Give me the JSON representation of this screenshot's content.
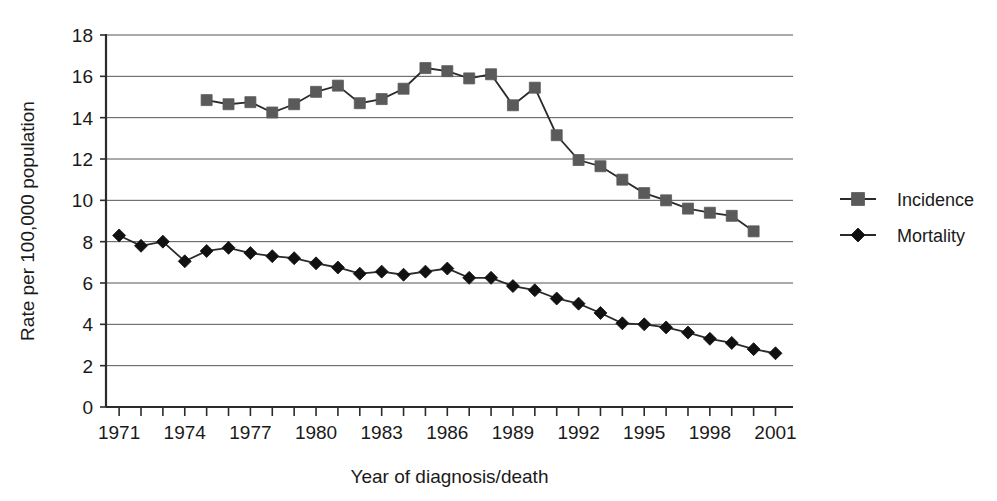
{
  "chart_data": {
    "type": "line",
    "title": "",
    "xlabel": "Year of diagnosis/death",
    "ylabel": "Rate per 100,000 population",
    "xlim": [
      1970.4,
      2001.8
    ],
    "ylim": [
      0,
      18
    ],
    "yticks": [
      0,
      2,
      4,
      6,
      8,
      10,
      12,
      14,
      16,
      18
    ],
    "ytick_labels": [
      "0",
      "2",
      "4",
      "6",
      "8",
      "10",
      "12",
      "14",
      "16",
      "18"
    ],
    "xticks": [
      1971,
      1972,
      1973,
      1974,
      1975,
      1976,
      1977,
      1978,
      1979,
      1980,
      1981,
      1982,
      1983,
      1984,
      1985,
      1986,
      1987,
      1988,
      1989,
      1990,
      1991,
      1992,
      1993,
      1994,
      1995,
      1996,
      1997,
      1998,
      1999,
      2000,
      2001
    ],
    "xtick_labels_shown": [
      "1971",
      "1974",
      "1977",
      "1980",
      "1983",
      "1986",
      "1989",
      "1992",
      "1995",
      "1998",
      "2001"
    ],
    "grid": "horizontal",
    "legend_position": "right",
    "series": [
      {
        "name": "Incidence",
        "marker": "square",
        "color": "#5a5a5a",
        "line_color": "#2a2a2a",
        "x": [
          1975,
          1976,
          1977,
          1978,
          1979,
          1980,
          1981,
          1982,
          1983,
          1984,
          1985,
          1986,
          1987,
          1988,
          1989,
          1990,
          1991,
          1992,
          1993,
          1994,
          1995,
          1996,
          1997,
          1998,
          1999,
          2000
        ],
        "values": [
          14.85,
          14.65,
          14.75,
          14.25,
          14.65,
          15.25,
          15.55,
          14.7,
          14.9,
          15.4,
          16.4,
          16.25,
          15.9,
          16.1,
          14.6,
          15.45,
          13.15,
          11.95,
          11.65,
          11.0,
          10.35,
          10.0,
          9.6,
          9.4,
          9.25,
          8.5
        ]
      },
      {
        "name": "Mortality",
        "marker": "diamond",
        "color": "#111111",
        "line_color": "#2a2a2a",
        "x": [
          1971,
          1972,
          1973,
          1974,
          1975,
          1976,
          1977,
          1978,
          1979,
          1980,
          1981,
          1982,
          1983,
          1984,
          1985,
          1986,
          1987,
          1988,
          1989,
          1990,
          1991,
          1992,
          1993,
          1994,
          1995,
          1996,
          1997,
          1998,
          1999,
          2000,
          2001
        ],
        "values": [
          8.3,
          7.8,
          8.0,
          7.05,
          7.55,
          7.7,
          7.45,
          7.3,
          7.2,
          6.95,
          6.75,
          6.45,
          6.55,
          6.4,
          6.55,
          6.7,
          6.25,
          6.25,
          5.85,
          5.65,
          5.25,
          5.0,
          4.55,
          4.05,
          4.0,
          3.85,
          3.6,
          3.3,
          3.1,
          2.8,
          2.6
        ]
      }
    ]
  },
  "legend": {
    "items": [
      {
        "label": "Incidence",
        "marker": "square-marker",
        "swatch_color": "#5a5a5a"
      },
      {
        "label": "Mortality",
        "marker": "diamond-marker",
        "swatch_color": "#111111"
      }
    ]
  }
}
